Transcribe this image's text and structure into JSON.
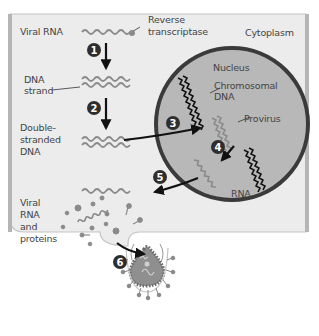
{
  "figure": {
    "top_caption_fragment": "infected cell",
    "cell_region_label": "Cytoplasm",
    "nucleus_label": "Nucleus",
    "colors": {
      "cell_fill": "#ececec",
      "cell_border": "#b9b9b9",
      "nucleus_fill": "#b5b5b5",
      "nucleus_border": "#3a3a3a",
      "chromosomal_dna": "#111111",
      "viral_nucleic_acid": "#8a8a8a",
      "step_badge": "#2e2e2e",
      "arrow": "#111111"
    },
    "labels": {
      "viral_rna": "Viral RNA",
      "reverse_transcriptase_1": "Reverse",
      "reverse_transcriptase_2": "transcriptase",
      "dna_strand_1": "DNA",
      "dna_strand_2": "strand",
      "ds_dna_1": "Double-",
      "ds_dna_2": "stranded",
      "ds_dna_3": "DNA",
      "chromosomal_dna_1": "Chromosomal",
      "chromosomal_dna_2": "DNA",
      "provirus": "Provirus",
      "rna": "RNA",
      "viral_rna_proteins_1": "Viral",
      "viral_rna_proteins_2": "RNA",
      "viral_rna_proteins_3": "and",
      "viral_rna_proteins_4": "proteins"
    },
    "steps": [
      {
        "number": "1",
        "description": "Reverse transcription of viral RNA to DNA strand"
      },
      {
        "number": "2",
        "description": "Synthesis of double-stranded DNA"
      },
      {
        "number": "3",
        "description": "Integration into chromosomal DNA as provirus"
      },
      {
        "number": "4",
        "description": "Transcription of provirus to RNA"
      },
      {
        "number": "5",
        "description": "RNA exported to cytoplasm"
      },
      {
        "number": "6",
        "description": "Assembly and budding of new virus"
      }
    ]
  }
}
